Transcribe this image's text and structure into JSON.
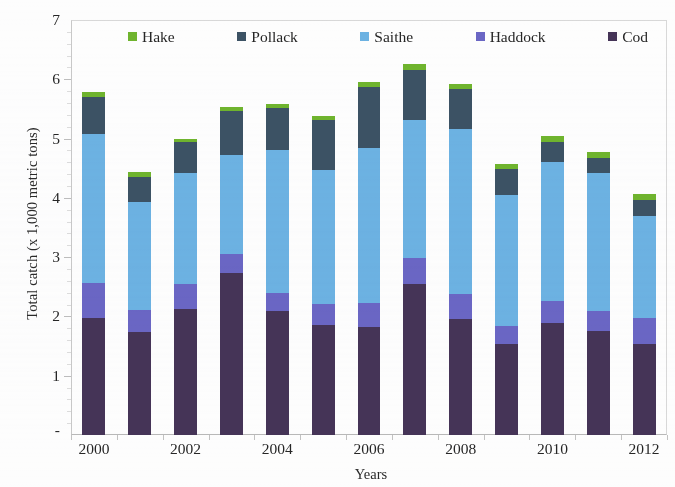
{
  "chart_data": {
    "type": "bar",
    "subtype": "stacked-bar",
    "title": "",
    "xlabel": "Years",
    "ylabel": "Total catch (x 1,000 metric tons)",
    "categories": [
      "2000",
      "2001",
      "2002",
      "2003",
      "2004",
      "2005",
      "2006",
      "2007",
      "2008",
      "2009",
      "2010",
      "2011",
      "2012"
    ],
    "x_tick_labels": [
      "2000",
      "",
      "2002",
      "",
      "2004",
      "",
      "2006",
      "",
      "2008",
      "",
      "2010",
      "",
      "2012"
    ],
    "y_tick_labels": [
      "7",
      "6",
      "5",
      "4",
      "3",
      "2",
      "1",
      "-"
    ],
    "y_tick_values": [
      7,
      6,
      5,
      4,
      3,
      2,
      1,
      0
    ],
    "ylim": [
      0,
      7
    ],
    "grid": false,
    "legend_position": "top-inside",
    "stack_order_bottom_to_top": [
      "Cod",
      "Haddock",
      "Saithe",
      "Pollack",
      "Hake"
    ],
    "series": [
      {
        "name": "Hake",
        "color": "#6fb42e",
        "values": [
          0.09,
          0.08,
          0.06,
          0.07,
          0.07,
          0.06,
          0.08,
          0.1,
          0.09,
          0.1,
          0.11,
          0.1,
          0.1
        ]
      },
      {
        "name": "Pollack",
        "color": "#3c5264",
        "values": [
          0.62,
          0.43,
          0.52,
          0.74,
          0.7,
          0.85,
          1.02,
          0.85,
          0.67,
          0.43,
          0.34,
          0.25,
          0.26
        ]
      },
      {
        "name": "Saithe",
        "color": "#6cb2e2",
        "values": [
          2.52,
          1.82,
          1.88,
          1.67,
          2.41,
          2.26,
          2.63,
          2.33,
          2.78,
          2.21,
          2.34,
          2.33,
          1.73
        ]
      },
      {
        "name": "Haddock",
        "color": "#6a66c4",
        "values": [
          0.58,
          0.38,
          0.42,
          0.32,
          0.31,
          0.36,
          0.4,
          0.43,
          0.43,
          0.31,
          0.37,
          0.34,
          0.44
        ]
      },
      {
        "name": "Cod",
        "color": "#453457",
        "values": [
          1.98,
          1.73,
          2.12,
          2.73,
          2.09,
          1.85,
          1.82,
          2.55,
          1.95,
          1.53,
          1.89,
          1.75,
          1.53
        ]
      }
    ],
    "totals": [
      5.79,
      4.44,
      5.0,
      5.53,
      5.58,
      5.38,
      5.95,
      6.26,
      5.92,
      4.58,
      5.05,
      4.77,
      4.06
    ]
  },
  "axes": {
    "y_title": "Total catch (x 1,000 metric tons)",
    "x_title": "Years",
    "y_ticks": [
      {
        "label": "7",
        "value": 7
      },
      {
        "label": "6",
        "value": 6
      },
      {
        "label": "5",
        "value": 5
      },
      {
        "label": "4",
        "value": 4
      },
      {
        "label": "3",
        "value": 3
      },
      {
        "label": "2",
        "value": 2
      },
      {
        "label": "1",
        "value": 1
      },
      {
        "label": "-",
        "value": 0
      }
    ],
    "x_ticks": [
      {
        "label": "2000",
        "index": 0
      },
      {
        "label": "2002",
        "index": 2
      },
      {
        "label": "2004",
        "index": 4
      },
      {
        "label": "2006",
        "index": 6
      },
      {
        "label": "2008",
        "index": 8
      },
      {
        "label": "2010",
        "index": 10
      },
      {
        "label": "2012",
        "index": 12
      }
    ]
  },
  "legend": {
    "items": [
      {
        "label": "Hake",
        "color": "#6fb42e"
      },
      {
        "label": "Pollack",
        "color": "#3c5264"
      },
      {
        "label": "Saithe",
        "color": "#6cb2e2"
      },
      {
        "label": "Haddock",
        "color": "#6a66c4"
      },
      {
        "label": "Cod",
        "color": "#453457"
      }
    ]
  },
  "colors": {
    "hake": "#6fb42e",
    "pollack": "#3c5264",
    "saithe": "#6cb2e2",
    "haddock": "#6a66c4",
    "cod": "#453457",
    "axis": "#c2c2c2",
    "text": "#262626",
    "background": "#fdfdfd"
  }
}
